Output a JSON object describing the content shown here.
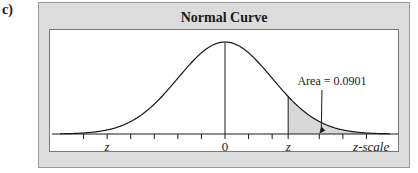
{
  "part_label": "c)",
  "chart_data": {
    "type": "area",
    "title": "Normal Curve",
    "xlabel": "z-scale",
    "ylabel": "",
    "xlim": [
      -3.5,
      3.5
    ],
    "distribution": "standard normal",
    "tick_labels": [
      {
        "x": -2.5,
        "label": "z",
        "italic": true
      },
      {
        "x": 0,
        "label": "0",
        "italic": false
      },
      {
        "x": 1.34,
        "label": "z",
        "italic": true
      },
      {
        "x": 3.1,
        "label": "z-scale",
        "italic": true
      }
    ],
    "minor_ticks": [
      -3,
      -2,
      -1.5,
      -1,
      -0.5,
      0.5,
      1,
      2,
      2.5,
      3
    ],
    "shaded_region": {
      "from": 1.34,
      "to": 3.5,
      "area": 0.0901,
      "color": "#d8d8d8"
    },
    "annotation": {
      "text": "Area = 0.0901",
      "points_to": 2.0
    },
    "center_line_x": 0,
    "grid": false,
    "legend": null
  },
  "colors": {
    "frame_bg": "#dcdcdc",
    "plot_bg": "#ffffff",
    "curve": "#1a1a1a",
    "shade": "#d8d8d8"
  }
}
